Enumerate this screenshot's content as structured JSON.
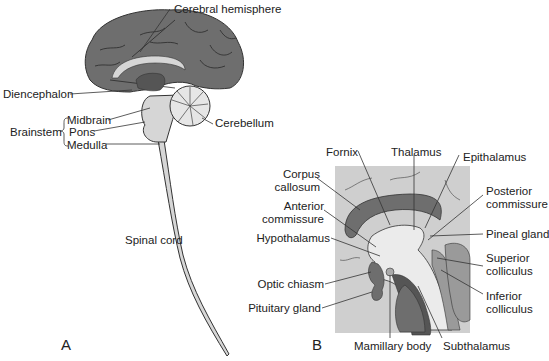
{
  "figure": {
    "panels": [
      {
        "id": "A",
        "letter": "A",
        "title": "Midsagittal view of the brain and spinal cord",
        "labels": {
          "cerebral_hemisphere": "Cerebral hemisphere",
          "diencephalon": "Diencephalon",
          "brainstem": "Brainstem",
          "midbrain": "Midbrain",
          "pons": "Pons",
          "medulla": "Medulla",
          "cerebellum": "Cerebellum",
          "spinal_cord": "Spinal cord"
        }
      },
      {
        "id": "B",
        "letter": "B",
        "title": "Enlarged view of diencephalon region",
        "labels": {
          "fornix": "Fornix",
          "thalamus": "Thalamus",
          "epithalamus": "Epithalamus",
          "corpus_callosum_1": "Corpus",
          "corpus_callosum_2": "callosum",
          "anterior_commissure_1": "Anterior",
          "anterior_commissure_2": "commissure",
          "posterior_commissure_1": "Posterior",
          "posterior_commissure_2": "commissure",
          "hypothalamus": "Hypothalamus",
          "pineal_gland": "Pineal gland",
          "superior_colliculus_1": "Superior",
          "superior_colliculus_2": "colliculus",
          "optic_chiasm": "Optic chiasm",
          "inferior_colliculus_1": "Inferior",
          "inferior_colliculus_2": "colliculus",
          "pituitary_gland": "Pituitary gland",
          "mamillary_body": "Mamillary body",
          "subthalamus": "Subthalamus"
        }
      }
    ],
    "colors": {
      "cortex": "#6e6e6e",
      "sulci": "#2a2a2a",
      "light_tissue": "#d6d6d6",
      "pale_tissue": "#ebebeb",
      "dark_tissue": "#555555",
      "background_box": "#cfcfcf",
      "outline": "#333333",
      "text": "#222222"
    }
  }
}
